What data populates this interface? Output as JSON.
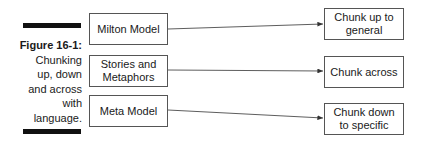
{
  "figure": {
    "label": "Figure 16-1:",
    "caption_lines": [
      "Chunking",
      "up, down",
      "and across",
      "with",
      "language."
    ]
  },
  "left_boxes": [
    {
      "label": "Milton Model"
    },
    {
      "label_lines": [
        "Stories and",
        "Metaphors"
      ]
    },
    {
      "label": "Meta Model"
    }
  ],
  "right_boxes": [
    {
      "label_lines": [
        "Chunk up to",
        "general"
      ]
    },
    {
      "label": "Chunk across"
    },
    {
      "label_lines": [
        "Chunk down",
        "to specific"
      ]
    }
  ],
  "colors": {
    "line": "#333333",
    "bar": "#111111",
    "box_border": "#555555"
  }
}
